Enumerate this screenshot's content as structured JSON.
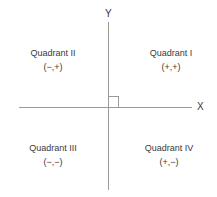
{
  "diagram": {
    "axes": {
      "y_label": "Y",
      "x_label": "X"
    },
    "origin_marker": "right-angle-symbol",
    "colors": {
      "axis": "#9a9a9a",
      "text": "#3a3a3a",
      "background": "#ffffff"
    },
    "quadrants": [
      {
        "name": "Quadrant II",
        "signs": "(−,+)"
      },
      {
        "name": "Quadrant I",
        "signs": "(+,+)"
      },
      {
        "name": "Quadrant III",
        "signs": "(−,−)"
      },
      {
        "name": "Quadrant IV",
        "signs": "(+,−)"
      }
    ]
  }
}
